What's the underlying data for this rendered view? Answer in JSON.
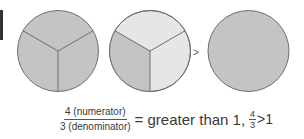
{
  "figure": {
    "colors": {
      "shaded": "#c4c4c4",
      "unshaded": "#e6e6e6",
      "stroke": "#6e6e6e",
      "edge_bar": "#333333"
    },
    "circles": [
      {
        "name": "whole-thirds-shaded",
        "parts": 3,
        "shaded_parts": 3
      },
      {
        "name": "one-third-shaded",
        "parts": 3,
        "shaded_parts": 1
      },
      {
        "name": "whole-circle-shaded",
        "parts": 1,
        "shaded_parts": 1
      }
    ],
    "comparison_symbol": ">"
  },
  "equation": {
    "numerator": "4 (numerator)",
    "denominator": "3 (denominator)",
    "equals_text": "= greater than 1,",
    "small_fraction": {
      "numerator": "4",
      "denominator": "3"
    },
    "comparison": ">1"
  }
}
